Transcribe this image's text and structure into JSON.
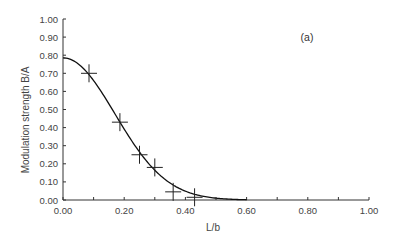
{
  "chart_data": {
    "type": "scatter",
    "title": "",
    "annotation": "(a)",
    "xlabel": "L/b",
    "ylabel": "Modulation strength B/A",
    "xlim": [
      0.0,
      1.0
    ],
    "ylim": [
      0.0,
      1.0
    ],
    "x_ticks": [
      "0.00",
      "0.20",
      "0.40",
      "0.60",
      "0.80",
      "1.00"
    ],
    "x_tick_values": [
      0.0,
      0.2,
      0.4,
      0.6,
      0.8,
      1.0
    ],
    "x_minor_ticks": [
      0.1,
      0.3,
      0.5,
      0.7,
      0.9
    ],
    "y_ticks": [
      "0.00",
      "0.10",
      "0.20",
      "0.30",
      "0.40",
      "0.50",
      "0.60",
      "0.70",
      "0.80",
      "0.90",
      "1.00"
    ],
    "y_tick_values": [
      0.0,
      0.1,
      0.2,
      0.3,
      0.4,
      0.5,
      0.6,
      0.7,
      0.8,
      0.9,
      1.0
    ],
    "grid": false,
    "legend": null,
    "series": [
      {
        "name": "measured",
        "kind": "scatter",
        "marker": "plus",
        "x": [
          0.085,
          0.186,
          0.25,
          0.3,
          0.36,
          0.43
        ],
        "y": [
          0.7,
          0.43,
          0.25,
          0.18,
          0.045,
          0.015
        ]
      },
      {
        "name": "fit",
        "kind": "line",
        "model": "0.785*exp(-(x/0.24)^2)",
        "x": [
          0.0,
          0.05,
          0.1,
          0.15,
          0.2,
          0.25,
          0.3,
          0.35,
          0.4,
          0.45,
          0.5,
          0.55,
          0.6
        ],
        "y": [
          0.785,
          0.751,
          0.66,
          0.531,
          0.392,
          0.265,
          0.165,
          0.094,
          0.049,
          0.023,
          0.01,
          0.004,
          0.002
        ]
      }
    ]
  }
}
